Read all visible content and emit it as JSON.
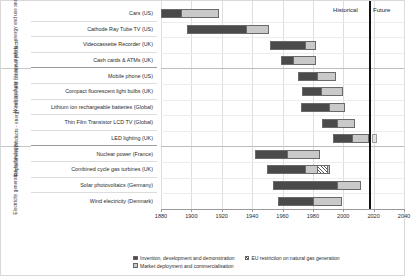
{
  "chart_data": {
    "type": "bar",
    "subtype": "horizontal-timeline-gantt",
    "title": "",
    "xlabel": "",
    "ylabel": "",
    "xlim": [
      1880,
      2040
    ],
    "xticks": [
      1880,
      1900,
      1920,
      1940,
      1960,
      1980,
      2000,
      2020,
      2040
    ],
    "xtick_labels": [
      "1880",
      "1900",
      "1920",
      "1940",
      "1960",
      "1980",
      "2000",
      "2020",
      "2040"
    ],
    "grid": true,
    "legend_position": "bottom-left",
    "annotations": [
      {
        "name": "present-day-divider",
        "x": 2017,
        "label_left": "Historical",
        "label_right": "Future"
      }
    ],
    "groups": [
      {
        "label": "Novel products for new markets - energy end use and consumer products",
        "rows": [
          {
            "label": "Cars (US)",
            "invention": [
              1880,
              1893
            ],
            "deployment": [
              1893,
              1918
            ]
          },
          {
            "label": "Cathode Ray Tube TV (US)",
            "invention": [
              1897,
              1936
            ],
            "deployment": [
              1936,
              1951
            ]
          },
          {
            "label": "Videocassette Recorder (UK)",
            "invention": [
              1952,
              1975
            ],
            "deployment": [
              1975,
              1982
            ]
          },
          {
            "label": "Cash cards & ATMs (UK)",
            "invention": [
              1959,
              1967
            ],
            "deployment": [
              1967,
              1982
            ]
          }
        ]
      },
      {
        "label": "Replacement products - energy end use and consumer products",
        "rows": [
          {
            "label": "Mobile phone (US)",
            "invention": [
              1970,
              1983
            ],
            "deployment": [
              1983,
              1995
            ]
          },
          {
            "label": "Compact fluorescent light bulbs (UK)",
            "invention": [
              1973,
              1985
            ],
            "deployment": [
              1985,
              2000
            ]
          },
          {
            "label": "Lithium ion rechargeable batteries (Global)",
            "invention": [
              1972,
              1991
            ],
            "deployment": [
              1991,
              2001
            ]
          },
          {
            "label": "Thin Film Transistor LCD TV (Global)",
            "invention": [
              1986,
              1996
            ],
            "deployment": [
              1996,
              2008
            ]
          },
          {
            "label": "LED lighting (UK)",
            "invention": [
              1993,
              2006
            ],
            "deployment": [
              2006,
              2017
            ],
            "end_marker": 2019
          }
        ]
      },
      {
        "label": "Electricity generation technologies",
        "rows": [
          {
            "label": "Nuclear power (France)",
            "invention": [
              1942,
              1963
            ],
            "deployment": [
              1963,
              1985
            ]
          },
          {
            "label": "Combined cycle gas turbines (UK)",
            "invention": [
              1950,
              1975
            ],
            "deployment": [
              1975,
              1991
            ],
            "eu_restriction": [
              1983,
              1991
            ]
          },
          {
            "label": "Solar photovoltaics (Germany)",
            "invention": [
              1954,
              1996
            ],
            "deployment": [
              1996,
              2012
            ]
          },
          {
            "label": "Wind electricity (Denmark)",
            "invention": [
              1957,
              1980
            ],
            "deployment": [
              1980,
              1999
            ]
          }
        ]
      }
    ],
    "legend": [
      {
        "key": "invention",
        "label": "Invention, development and demonstration",
        "color": "#4a4a4a"
      },
      {
        "key": "eu_restriction",
        "label": "EU restriction on natural gas generation",
        "color": "#5a5a5a"
      },
      {
        "key": "deployment",
        "label": "Market deployment and commercialisation",
        "color": "#c9c9c9"
      }
    ]
  }
}
